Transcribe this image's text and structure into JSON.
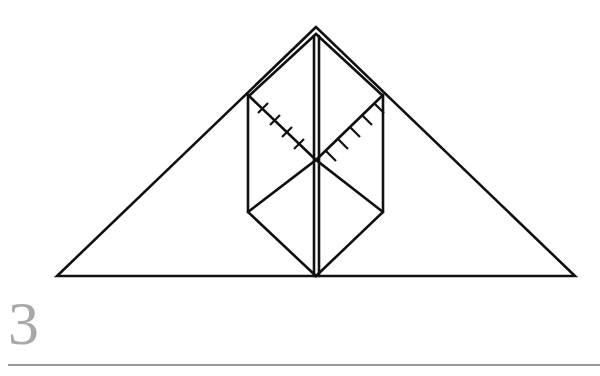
{
  "step": {
    "number": "3"
  },
  "diagram": {
    "stroke_color": "#111111",
    "step_number_color": "#a8a8a8",
    "rule_color": "#9a9a9a",
    "elements": [
      "large triangle outline",
      "vertical center crease",
      "hexagonal folded flap",
      "two diagonal valley-fold lines with hatch marks"
    ]
  }
}
